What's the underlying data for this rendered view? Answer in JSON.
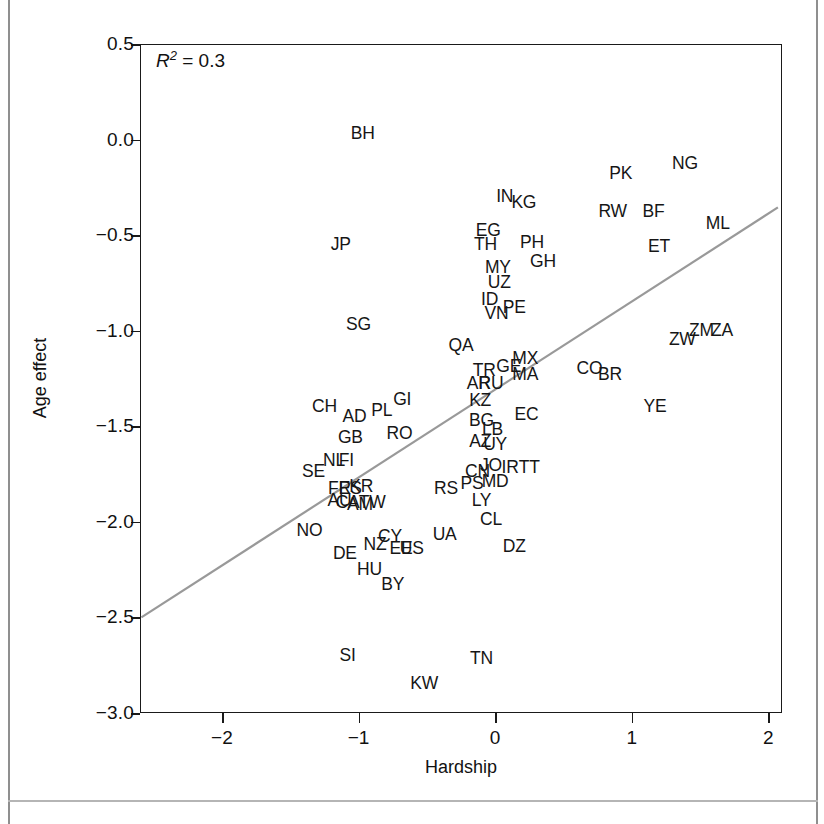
{
  "chart_data": {
    "type": "scatter",
    "title": "",
    "xlabel": "Hardship",
    "ylabel": "Age effect",
    "xlim": [
      -2.6,
      2.1
    ],
    "ylim": [
      -3.0,
      0.5
    ],
    "xticks": [
      -2,
      -1,
      0,
      1,
      2
    ],
    "xticklabels": [
      "−2",
      "−1",
      "0",
      "1",
      "2"
    ],
    "yticks": [
      0.5,
      0.0,
      -0.5,
      -1.0,
      -1.5,
      -2.0,
      -2.5,
      -3.0
    ],
    "yticklabels": [
      "0.5",
      "0.0",
      "−0.5",
      "−1.0",
      "−1.5",
      "−2.0",
      "−2.5",
      "−3.0"
    ],
    "grid": false,
    "legend": null,
    "annotations": [
      {
        "name": "r-squared",
        "text": "R2 = 0.3",
        "r_symbol": "R",
        "superscript": "2",
        "equals_value": "= 0.3",
        "x": -2.48,
        "y": 0.41
      }
    ],
    "fit_line": {
      "name": "regression-line",
      "color": "#999999",
      "x": [
        -2.59,
        2.07
      ],
      "y": [
        -2.5,
        -0.355
      ]
    },
    "point_label_style": "country-code-text",
    "points": [
      {
        "label": "BH",
        "x": -0.97,
        "y": 0.03
      },
      {
        "label": "JP",
        "x": -1.13,
        "y": -0.55
      },
      {
        "label": "SG",
        "x": -1.0,
        "y": -0.97
      },
      {
        "label": "IN",
        "x": 0.07,
        "y": -0.3
      },
      {
        "label": "KG",
        "x": 0.21,
        "y": -0.33
      },
      {
        "label": "PK",
        "x": 0.92,
        "y": -0.18
      },
      {
        "label": "NG",
        "x": 1.39,
        "y": -0.13
      },
      {
        "label": "RW",
        "x": 0.86,
        "y": -0.38
      },
      {
        "label": "BF",
        "x": 1.16,
        "y": -0.38
      },
      {
        "label": "ML",
        "x": 1.63,
        "y": -0.44
      },
      {
        "label": "EG",
        "x": -0.05,
        "y": -0.48
      },
      {
        "label": "TH",
        "x": -0.07,
        "y": -0.55
      },
      {
        "label": "PH",
        "x": 0.27,
        "y": -0.54
      },
      {
        "label": "GH",
        "x": 0.35,
        "y": -0.64
      },
      {
        "label": "ET",
        "x": 1.2,
        "y": -0.56
      },
      {
        "label": "MY",
        "x": 0.02,
        "y": -0.67
      },
      {
        "label": "UZ",
        "x": 0.03,
        "y": -0.75
      },
      {
        "label": "ID",
        "x": -0.04,
        "y": -0.84
      },
      {
        "label": "VN",
        "x": 0.01,
        "y": -0.91
      },
      {
        "label": "PE",
        "x": 0.14,
        "y": -0.88
      },
      {
        "label": "ZW",
        "x": 1.37,
        "y": -1.05
      },
      {
        "label": "ZM",
        "x": 1.51,
        "y": -1.0
      },
      {
        "label": "ZA",
        "x": 1.66,
        "y": -1.0
      },
      {
        "label": "QA",
        "x": -0.25,
        "y": -1.08
      },
      {
        "label": "MX",
        "x": 0.22,
        "y": -1.15
      },
      {
        "label": "GE",
        "x": 0.1,
        "y": -1.19
      },
      {
        "label": "TR",
        "x": -0.08,
        "y": -1.21
      },
      {
        "label": "MA",
        "x": 0.22,
        "y": -1.23
      },
      {
        "label": "CO",
        "x": 0.69,
        "y": -1.2
      },
      {
        "label": "BR",
        "x": 0.84,
        "y": -1.23
      },
      {
        "label": "AR",
        "x": -0.12,
        "y": -1.28
      },
      {
        "label": "RU",
        "x": -0.03,
        "y": -1.28
      },
      {
        "label": "KZ",
        "x": -0.11,
        "y": -1.37
      },
      {
        "label": "CH",
        "x": -1.25,
        "y": -1.4
      },
      {
        "label": "AD",
        "x": -1.03,
        "y": -1.45
      },
      {
        "label": "PL",
        "x": -0.83,
        "y": -1.42
      },
      {
        "label": "GI",
        "x": -0.68,
        "y": -1.36
      },
      {
        "label": "EC",
        "x": 0.23,
        "y": -1.44
      },
      {
        "label": "YE",
        "x": 1.17,
        "y": -1.4
      },
      {
        "label": "BG",
        "x": -0.1,
        "y": -1.47
      },
      {
        "label": "GB",
        "x": -1.06,
        "y": -1.56
      },
      {
        "label": "RO",
        "x": -0.7,
        "y": -1.54
      },
      {
        "label": "LB",
        "x": -0.02,
        "y": -1.52
      },
      {
        "label": "AZ",
        "x": -0.11,
        "y": -1.58
      },
      {
        "label": "UY",
        "x": 0.0,
        "y": -1.6
      },
      {
        "label": "NL",
        "x": -1.18,
        "y": -1.68
      },
      {
        "label": "FI",
        "x": -1.09,
        "y": -1.68
      },
      {
        "label": "SE",
        "x": -1.33,
        "y": -1.74
      },
      {
        "label": "CN",
        "x": -0.13,
        "y": -1.74
      },
      {
        "label": "JO",
        "x": -0.03,
        "y": -1.71
      },
      {
        "label": "IR",
        "x": 0.11,
        "y": -1.72
      },
      {
        "label": "TT",
        "x": 0.25,
        "y": -1.72
      },
      {
        "label": "MD",
        "x": 0.0,
        "y": -1.79
      },
      {
        "label": "PS",
        "x": -0.17,
        "y": -1.8
      },
      {
        "label": "FR",
        "x": -1.14,
        "y": -1.83
      },
      {
        "label": "ES",
        "x": -1.06,
        "y": -1.83
      },
      {
        "label": "KR",
        "x": -0.98,
        "y": -1.82
      },
      {
        "label": "RS",
        "x": -0.36,
        "y": -1.83
      },
      {
        "label": "AU",
        "x": -1.14,
        "y": -1.89
      },
      {
        "label": "CA",
        "x": -1.08,
        "y": -1.9
      },
      {
        "label": "AM",
        "x": -0.99,
        "y": -1.91
      },
      {
        "label": "TW",
        "x": -0.9,
        "y": -1.9
      },
      {
        "label": "LY",
        "x": -0.1,
        "y": -1.89
      },
      {
        "label": "NO",
        "x": -1.36,
        "y": -2.05
      },
      {
        "label": "CL",
        "x": -0.03,
        "y": -1.99
      },
      {
        "label": "CY",
        "x": -0.77,
        "y": -2.08
      },
      {
        "label": "UA",
        "x": -0.37,
        "y": -2.07
      },
      {
        "label": "NZ",
        "x": -0.88,
        "y": -2.12
      },
      {
        "label": "EE",
        "x": -0.69,
        "y": -2.14
      },
      {
        "label": "US",
        "x": -0.61,
        "y": -2.14
      },
      {
        "label": "DZ",
        "x": 0.14,
        "y": -2.13
      },
      {
        "label": "DE",
        "x": -1.1,
        "y": -2.17
      },
      {
        "label": "HU",
        "x": -0.92,
        "y": -2.25
      },
      {
        "label": "BY",
        "x": -0.75,
        "y": -2.33
      },
      {
        "label": "SI",
        "x": -1.08,
        "y": -2.7
      },
      {
        "label": "TN",
        "x": -0.1,
        "y": -2.72
      },
      {
        "label": "KW",
        "x": -0.52,
        "y": -2.85
      }
    ]
  }
}
